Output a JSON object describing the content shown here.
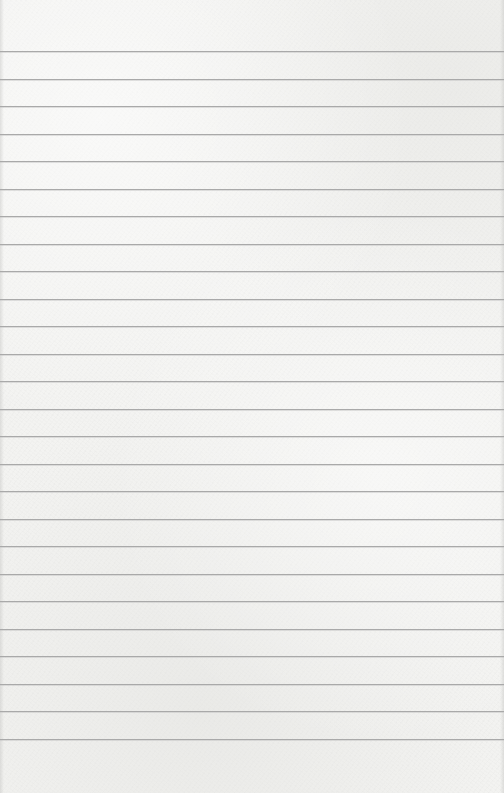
{
  "page": {
    "type": "ruled-notepaper",
    "width": 504,
    "height": 793,
    "background_color": "#f3f3f1",
    "line_color": "#a9a9a9"
  },
  "rules": {
    "count": 26,
    "first_y": 51,
    "spacing": 27.52,
    "positions": [
      51,
      79,
      106,
      134,
      161,
      189,
      216,
      244,
      271,
      299,
      326,
      354,
      381,
      409,
      436,
      464,
      491,
      519,
      546,
      574,
      601,
      629,
      656,
      684,
      711,
      739
    ]
  }
}
